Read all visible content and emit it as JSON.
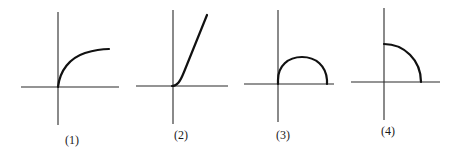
{
  "figure": {
    "panels": [
      {
        "id": 1,
        "label": "(1)",
        "curve_shape": "concave-increasing curve starting at origin, flattening out (like sqrt or log)"
      },
      {
        "id": 2,
        "label": "(2)",
        "curve_shape": "convex-increasing curve starting at origin, steepening (like x squared)"
      },
      {
        "id": 3,
        "label": "(3)",
        "curve_shape": "semicircle above positive x-axis, starting at origin"
      },
      {
        "id": 4,
        "label": "(4)",
        "curve_shape": "quarter circle in first quadrant from positive y-axis to positive x-axis"
      }
    ],
    "colors": {
      "background": "#ffffff",
      "axis": "#2a2a2a",
      "curve": "#111111"
    }
  }
}
